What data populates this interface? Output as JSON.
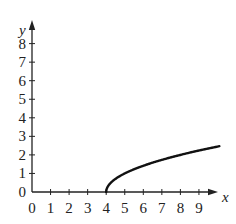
{
  "chart_data": {
    "type": "line",
    "title": "",
    "function": "y = sqrt(x - 4)",
    "xlabel": "x",
    "ylabel": "y",
    "xlim": [
      0,
      10.2
    ],
    "ylim": [
      0,
      8.8
    ],
    "x_ticks": [
      0,
      1,
      2,
      3,
      4,
      5,
      6,
      7,
      8,
      9
    ],
    "x_tick_labels": [
      "0",
      "1",
      "2",
      "3",
      "4",
      "5",
      "6",
      "7",
      "8",
      "9"
    ],
    "y_ticks": [
      0,
      1,
      2,
      3,
      4,
      5,
      6,
      7,
      8
    ],
    "y_tick_labels": [
      "0",
      "1",
      "2",
      "3",
      "4",
      "5",
      "6",
      "7",
      "8"
    ],
    "grid": false,
    "legend": null,
    "series": [
      {
        "name": "sqrt(x-4)",
        "x": [
          4,
          4.05,
          4.2,
          4.5,
          5,
          5.5,
          6,
          6.5,
          7,
          7.5,
          8,
          8.5,
          9,
          9.5,
          10,
          10.1
        ],
        "y": [
          0,
          0.224,
          0.447,
          0.707,
          1.0,
          1.225,
          1.414,
          1.581,
          1.732,
          1.871,
          2.0,
          2.121,
          2.236,
          2.345,
          2.449,
          2.47
        ]
      }
    ],
    "colors": {
      "axis": "#222222",
      "curve": "#111111"
    }
  }
}
